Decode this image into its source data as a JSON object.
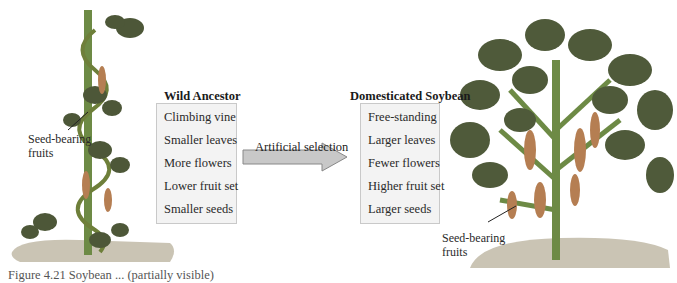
{
  "wild": {
    "title": "Wild Ancestor",
    "traits": [
      "Climbing  vine",
      "Smaller leaves",
      "More flowers",
      "Lower fruit set",
      "Smaller seeds"
    ]
  },
  "domesticated": {
    "title": "Domesticated Soybean",
    "traits": [
      "Free-standing",
      "Larger leaves",
      "Fewer flowers",
      "Higher fruit set",
      "Larger seeds"
    ]
  },
  "arrow": {
    "label": "Artificial selection"
  },
  "left_plant": {
    "label_line1": "Seed-bearing",
    "label_line2": "fruits"
  },
  "right_plant": {
    "label_line1": "Seed-bearing",
    "label_line2": "fruits"
  },
  "caption": "Figure 4.21   Soybean ... (partially visible)",
  "colors": {
    "leaf": "#4f5a3a",
    "stem": "#5b7a3c",
    "pod": "#b0784a",
    "soil": "#c9c3b2",
    "box": "#f3f3f3",
    "arrow": "#c8c8c8"
  }
}
